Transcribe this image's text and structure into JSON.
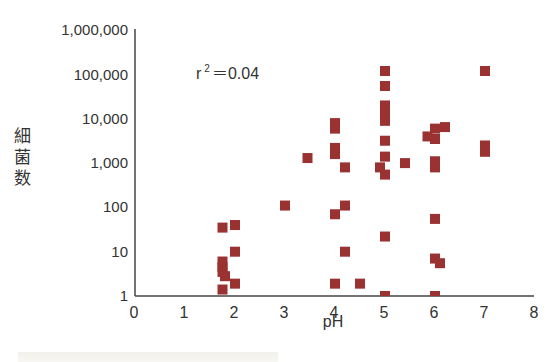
{
  "chart_data": {
    "type": "scatter",
    "title": "",
    "xlabel": "pH",
    "ylabel": "細菌数",
    "xlim": [
      0,
      8
    ],
    "ylim": [
      1,
      1000000
    ],
    "yscale": "log",
    "x_ticks": [
      "0",
      "1",
      "2",
      "3",
      "4",
      "5",
      "6",
      "7",
      "8"
    ],
    "y_ticks": [
      "1",
      "10",
      "100",
      "1,000",
      "10,000",
      "100,000",
      "1,000,000"
    ],
    "annotation": "r² =0.04",
    "grid": false,
    "legend": null,
    "marker": "square",
    "marker_color": "#9a3232",
    "points": [
      {
        "x": 1.75,
        "y": 35
      },
      {
        "x": 2.0,
        "y": 40
      },
      {
        "x": 2.0,
        "y": 10
      },
      {
        "x": 1.75,
        "y": 6
      },
      {
        "x": 1.75,
        "y": 4.5
      },
      {
        "x": 1.75,
        "y": 3.5
      },
      {
        "x": 1.8,
        "y": 2.8
      },
      {
        "x": 2.0,
        "y": 1.9
      },
      {
        "x": 1.75,
        "y": 1.4
      },
      {
        "x": 3.0,
        "y": 110
      },
      {
        "x": 3.45,
        "y": 1300
      },
      {
        "x": 4.0,
        "y": 8000
      },
      {
        "x": 4.0,
        "y": 6000
      },
      {
        "x": 4.0,
        "y": 2200
      },
      {
        "x": 4.0,
        "y": 1600
      },
      {
        "x": 4.2,
        "y": 800
      },
      {
        "x": 4.2,
        "y": 110
      },
      {
        "x": 4.0,
        "y": 70
      },
      {
        "x": 4.2,
        "y": 10
      },
      {
        "x": 4.0,
        "y": 1.9
      },
      {
        "x": 4.5,
        "y": 1.9
      },
      {
        "x": 5.0,
        "y": 120000
      },
      {
        "x": 5.0,
        "y": 55000
      },
      {
        "x": 5.0,
        "y": 20000
      },
      {
        "x": 5.0,
        "y": 13000
      },
      {
        "x": 5.0,
        "y": 9000
      },
      {
        "x": 5.0,
        "y": 3200
      },
      {
        "x": 5.0,
        "y": 1400
      },
      {
        "x": 4.9,
        "y": 800
      },
      {
        "x": 5.0,
        "y": 550
      },
      {
        "x": 5.4,
        "y": 1000
      },
      {
        "x": 5.0,
        "y": 22
      },
      {
        "x": 5.0,
        "y": 1
      },
      {
        "x": 6.0,
        "y": 6000
      },
      {
        "x": 6.2,
        "y": 6500
      },
      {
        "x": 5.85,
        "y": 4000
      },
      {
        "x": 6.0,
        "y": 3500
      },
      {
        "x": 6.0,
        "y": 1100
      },
      {
        "x": 6.0,
        "y": 800
      },
      {
        "x": 6.0,
        "y": 55
      },
      {
        "x": 6.0,
        "y": 7
      },
      {
        "x": 6.1,
        "y": 5.5
      },
      {
        "x": 6.0,
        "y": 1
      },
      {
        "x": 7.0,
        "y": 120000
      },
      {
        "x": 7.0,
        "y": 2500
      },
      {
        "x": 7.0,
        "y": 1800
      }
    ]
  },
  "labels": {
    "xlabel": "pH",
    "ylabel_chars": [
      "細",
      "菌",
      "数"
    ],
    "annotation_r": "r",
    "annotation_sup": "2",
    "annotation_rest": "＝0.04"
  }
}
